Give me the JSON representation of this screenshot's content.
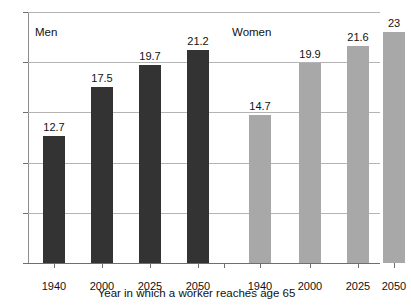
{
  "chart_data": {
    "type": "bar",
    "title": "",
    "subtitle": "",
    "xlabel": "Year in which a worker reaches age 65",
    "ylabel": "",
    "ylim": [
      0,
      25
    ],
    "yticks": [
      0,
      5,
      10,
      15,
      20,
      25
    ],
    "ytick_labels": [
      "0",
      "5",
      "10",
      "15",
      "20",
      "25"
    ],
    "grid": true,
    "legend_position": "in-plot-annotations",
    "categories": [
      "1940",
      "2000",
      "2025",
      "2050"
    ],
    "series": [
      {
        "name": "Men",
        "color": "#333333",
        "values": [
          12.7,
          17.5,
          19.7,
          21.2
        ],
        "value_labels": [
          "12.7",
          "17.5",
          "19.7",
          "21.2"
        ]
      },
      {
        "name": "Women",
        "color": "#a8a8a8",
        "values": [
          14.7,
          19.9,
          21.6,
          23
        ],
        "value_labels": [
          "14.7",
          "19.9",
          "21.6",
          "23"
        ]
      }
    ],
    "annotations": [
      {
        "text": "Men",
        "x": 35,
        "y": 26
      },
      {
        "text": "Women",
        "x": 232,
        "y": 26
      }
    ],
    "xtick_labels": [
      "1940",
      "2000",
      "2025",
      "2050",
      "1940",
      "2000",
      "2025",
      "2050"
    ]
  },
  "axis": {
    "x_title": "Year in which a worker reaches age 65"
  },
  "groups": {
    "men_label": "Men",
    "women_label": "Women"
  }
}
